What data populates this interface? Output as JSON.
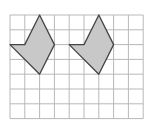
{
  "diagram": {
    "grid": {
      "columns": 9,
      "rows": 7
    },
    "colors": {
      "grid_line": "#b8b8b8",
      "shape_fill": "#c8c8c8",
      "shape_stroke": "#444444",
      "background": "#ffffff"
    },
    "shapes": [
      {
        "name": "left-shape",
        "vertices": [
          [
            2,
            0
          ],
          [
            3,
            2
          ],
          [
            2,
            4
          ],
          [
            0,
            2
          ],
          [
            1,
            2
          ]
        ]
      },
      {
        "name": "right-shape",
        "vertices": [
          [
            6,
            0
          ],
          [
            7,
            2
          ],
          [
            6,
            4
          ],
          [
            4,
            2
          ],
          [
            5,
            2
          ]
        ]
      }
    ]
  }
}
